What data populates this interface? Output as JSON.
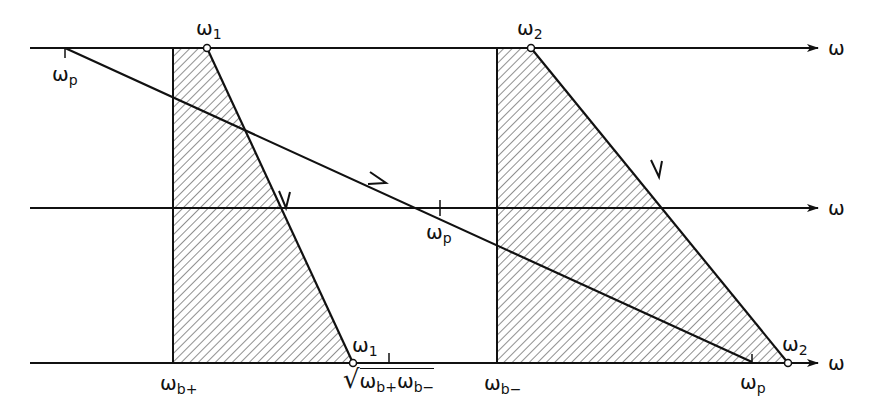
{
  "diagram": {
    "type": "frequency-mapping diagram",
    "axis_symbol": "ω",
    "axes": [
      {
        "name": "top",
        "label": "ω"
      },
      {
        "name": "middle",
        "label": "ω"
      },
      {
        "name": "bottom",
        "label": "ω"
      }
    ],
    "labels": {
      "top_omega1": {
        "base": "ω",
        "sub": "1"
      },
      "top_omega2": {
        "base": "ω",
        "sub": "2"
      },
      "top_omegap": {
        "base": "ω",
        "sub": "p"
      },
      "mid_omegap": {
        "base": "ω",
        "sub": "p"
      },
      "bot_omega1": {
        "base": "ω",
        "sub": "1"
      },
      "bot_omega2": {
        "base": "ω",
        "sub": "2"
      },
      "bot_omegap": {
        "base": "ω",
        "sub": "p"
      },
      "omega_bplus": {
        "base": "ω",
        "sub": "b+"
      },
      "omega_bminus": {
        "base": "ω",
        "sub": "b−"
      },
      "sqrt_label": {
        "radical": "√",
        "a": "ω",
        "a_sub": "b+",
        "b": "ω",
        "b_sub": "b−"
      }
    },
    "colors": {
      "ink": "#111111",
      "background": "#ffffff"
    }
  }
}
